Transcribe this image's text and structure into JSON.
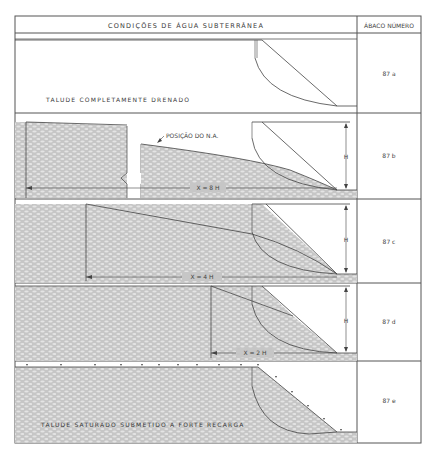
{
  "header": {
    "title": "CONDIÇÕES DE ÁGUA SUBTERRÂNEA",
    "column_label": "ÁBACO NÚMERO"
  },
  "panels": [
    {
      "id": "a",
      "abaco": "87 a",
      "caption": "TALUDE COMPLETAMENTE DRENADO"
    },
    {
      "id": "b",
      "abaco": "87 b",
      "annotation": "POSIÇÃO DO N.A.",
      "distance": "X = 8 H",
      "height": "H"
    },
    {
      "id": "c",
      "abaco": "87 c",
      "distance": "X = 4 H",
      "height": "H"
    },
    {
      "id": "d",
      "abaco": "87 d",
      "distance": "X = 2 H",
      "height": "H"
    },
    {
      "id": "e",
      "abaco": "87 e",
      "caption": "TALUDE SATURADO SUBMETIDO A FORTE RECARGA"
    }
  ],
  "colors": {
    "line": "#444444",
    "soil": "#c9c9c9",
    "soil_pattern": "#e6e6e6",
    "background": "#ffffff"
  }
}
